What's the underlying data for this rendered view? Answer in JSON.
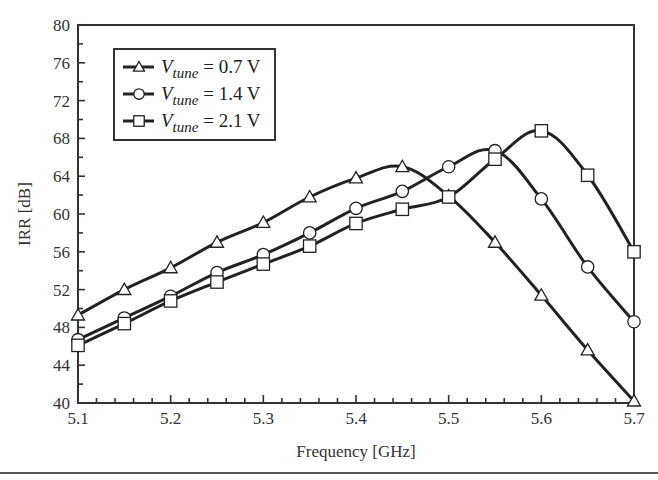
{
  "chart_data": {
    "type": "line",
    "title": "",
    "xlabel": "Frequency [GHz]",
    "ylabel": "IRR [dB]",
    "xlim": [
      5.1,
      5.7
    ],
    "ylim": [
      40,
      80
    ],
    "x_ticks": [
      "5.1",
      "5.2",
      "5.3",
      "5.4",
      "5.5",
      "5.6",
      "5.7"
    ],
    "y_ticks": [
      "40",
      "44",
      "48",
      "52",
      "56",
      "60",
      "64",
      "68",
      "72",
      "76",
      "80"
    ],
    "grid": false,
    "legend_position": "upper-left",
    "x": [
      5.1,
      5.15,
      5.2,
      5.25,
      5.3,
      5.35,
      5.4,
      5.45,
      5.5,
      5.55,
      5.6,
      5.65,
      5.7
    ],
    "series": [
      {
        "name": "V_tune = 0.7 V",
        "label_main": "V",
        "label_sub": "tune",
        "label_rest": " = 0.7 V",
        "marker": "triangle",
        "values": [
          49.3,
          52.0,
          54.3,
          57.0,
          59.1,
          61.8,
          63.8,
          65.0,
          61.9,
          57.0,
          51.4,
          45.6,
          40.2
        ]
      },
      {
        "name": "V_tune = 1.4 V",
        "label_main": "V",
        "label_sub": "tune",
        "label_rest": " = 1.4 V",
        "marker": "circle",
        "values": [
          46.7,
          49.0,
          51.3,
          53.8,
          55.7,
          58.0,
          60.6,
          62.4,
          65.0,
          66.7,
          61.6,
          54.4,
          48.6
        ]
      },
      {
        "name": "V_tune = 2.1 V",
        "label_main": "V",
        "label_sub": "tune",
        "label_rest": " = 2.1 V",
        "marker": "square",
        "values": [
          46.1,
          48.4,
          50.8,
          52.8,
          54.7,
          56.6,
          59.0,
          60.5,
          61.8,
          65.8,
          68.8,
          64.1,
          56.0
        ]
      }
    ],
    "colors": {
      "line": "#222222",
      "marker_fill": "#ffffff",
      "frame": "#333333"
    }
  }
}
